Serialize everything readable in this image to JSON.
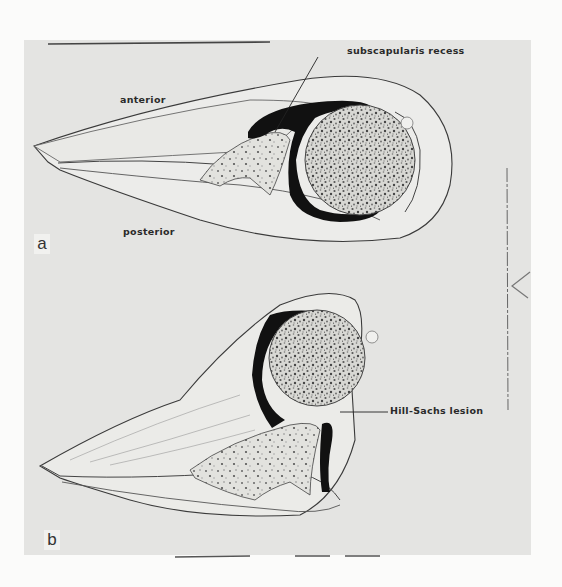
{
  "figure": {
    "panels": [
      {
        "id": "a",
        "letter": "a",
        "labels": {
          "anterior": "anterior",
          "posterior": "posterior",
          "callout": "subscapularis recess"
        }
      },
      {
        "id": "b",
        "letter": "b",
        "labels": {
          "callout": "Hill-Sachs lesion"
        }
      }
    ],
    "colors": {
      "page_background": "#fbfbfa",
      "panel_background": "#e4e4e2",
      "tissue_fill": "#eeeeec",
      "bone_fill": "#dcdcd8",
      "fluid_black": "#111111",
      "outline": "#3a3a3a"
    }
  }
}
